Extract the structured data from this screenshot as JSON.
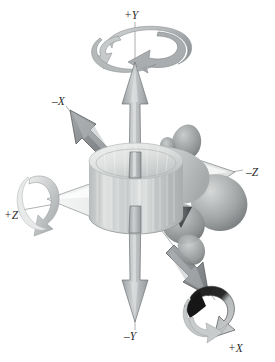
{
  "figure": {
    "type": "anatomical-coordinate-diagram",
    "background_color": "#ffffff"
  },
  "axes": {
    "plus_y": {
      "label": "+Y",
      "sign": "+",
      "letter": "Y",
      "direction": "up",
      "x": 131,
      "y": 14
    },
    "minus_y": {
      "label": "–Y",
      "sign": "–",
      "letter": "Y",
      "direction": "down",
      "x": 130,
      "y": 334
    },
    "minus_x": {
      "label": "–X",
      "sign": "–",
      "letter": "X",
      "direction": "up-left",
      "x": 58,
      "y": 99
    },
    "plus_x": {
      "label": "+X",
      "sign": "+",
      "letter": "X",
      "direction": "down-right",
      "x": 232,
      "y": 348
    },
    "plus_z": {
      "label": "+Z",
      "sign": "+",
      "letter": "Z",
      "direction": "left",
      "x": 9,
      "y": 214
    },
    "minus_z": {
      "label": "–Z",
      "sign": "–",
      "letter": "Z",
      "direction": "right",
      "x": 248,
      "y": 172
    }
  },
  "translation_arrows": [
    {
      "name": "arrow-plus-y",
      "axis": "+Y",
      "fill": "#b9bcbd",
      "stroke": "#6f7375"
    },
    {
      "name": "arrow-minus-y",
      "axis": "–Y",
      "fill": "#b9bcbd",
      "stroke": "#6f7375"
    },
    {
      "name": "arrow-minus-x",
      "axis": "–X",
      "fill": "#8c9093",
      "stroke": "#4d5052"
    },
    {
      "name": "arrow-plus-x",
      "axis": "+X",
      "fill": "#8c9093",
      "stroke": "#4d5052"
    },
    {
      "name": "arrow-plus-z",
      "axis": "+Z",
      "fill": "#f2f3f3",
      "stroke": "#8d9194"
    },
    {
      "name": "arrow-minus-z",
      "axis": "–Z",
      "fill": "#e6e8e8",
      "stroke": "#7c8082"
    }
  ],
  "rotation_arrows": [
    {
      "name": "rotation-about-y",
      "axis": "+Y",
      "fill_light": "#c8cbcc",
      "fill_dark": "#9a9ea0"
    },
    {
      "name": "rotation-about-z",
      "axis": "+Z",
      "fill_light": "#dcdedf",
      "fill_dark": "#a6aaac"
    },
    {
      "name": "rotation-about-x",
      "axis": "+X",
      "fill_light": "#c5c8c9",
      "fill_dark": "#151515"
    }
  ],
  "anatomy": {
    "vertebral_body": {
      "name": "vertebral-body",
      "fill": "#d3d5d5"
    },
    "endplate": {
      "name": "superior-endplate",
      "fill": "#e4e6e6"
    },
    "pedicle": {
      "name": "pedicle",
      "fill": "#c6c9c9"
    },
    "transverse_process": {
      "name": "transverse-process",
      "fill": "#b0b4b5"
    },
    "spinous_process": {
      "name": "spinous-process",
      "fill": "#9a9d9e"
    },
    "facet_shadow": {
      "name": "facet-shadow",
      "fill": "#3f4142"
    }
  },
  "colors": {
    "ink": "#2b2b2b",
    "mid_gray": "#9a9ea0",
    "dark": "#151515"
  }
}
